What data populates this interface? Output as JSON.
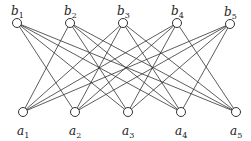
{
  "diagram": {
    "type": "bipartite-graph",
    "top_nodes": [
      {
        "id": "b1",
        "base": "b",
        "sub": "1",
        "x": 17,
        "y": 23
      },
      {
        "id": "b2",
        "base": "b",
        "sub": "2",
        "x": 70,
        "y": 23
      },
      {
        "id": "b3",
        "base": "b",
        "sub": "3",
        "x": 123,
        "y": 23
      },
      {
        "id": "b4",
        "base": "b",
        "sub": "4",
        "x": 177,
        "y": 23
      },
      {
        "id": "b5",
        "base": "b",
        "sub": "5",
        "x": 230,
        "y": 24
      }
    ],
    "bottom_nodes": [
      {
        "id": "a1",
        "base": "a",
        "sub": "1",
        "x": 23,
        "y": 112
      },
      {
        "id": "a2",
        "base": "a",
        "sub": "2",
        "x": 75,
        "y": 112
      },
      {
        "id": "a3",
        "base": "a",
        "sub": "3",
        "x": 128,
        "y": 112
      },
      {
        "id": "a4",
        "base": "a",
        "sub": "4",
        "x": 181,
        "y": 112
      },
      {
        "id": "a5",
        "base": "a",
        "sub": "5",
        "x": 236,
        "y": 112
      }
    ],
    "edges": [
      [
        "b1",
        "a2"
      ],
      [
        "b1",
        "a3"
      ],
      [
        "b1",
        "a4"
      ],
      [
        "b1",
        "a5"
      ],
      [
        "b2",
        "a1"
      ],
      [
        "b2",
        "a3"
      ],
      [
        "b2",
        "a4"
      ],
      [
        "b2",
        "a5"
      ],
      [
        "b3",
        "a1"
      ],
      [
        "b3",
        "a2"
      ],
      [
        "b3",
        "a4"
      ],
      [
        "b3",
        "a5"
      ],
      [
        "b4",
        "a1"
      ],
      [
        "b4",
        "a2"
      ],
      [
        "b4",
        "a3"
      ],
      [
        "b4",
        "a5"
      ],
      [
        "b5",
        "a1"
      ],
      [
        "b5",
        "a2"
      ],
      [
        "b5",
        "a3"
      ],
      [
        "b5",
        "a4"
      ]
    ],
    "node_radius": 4.5,
    "colors": {
      "stroke": "#333333",
      "node_fill": "#ffffff",
      "label": "#222222"
    }
  }
}
